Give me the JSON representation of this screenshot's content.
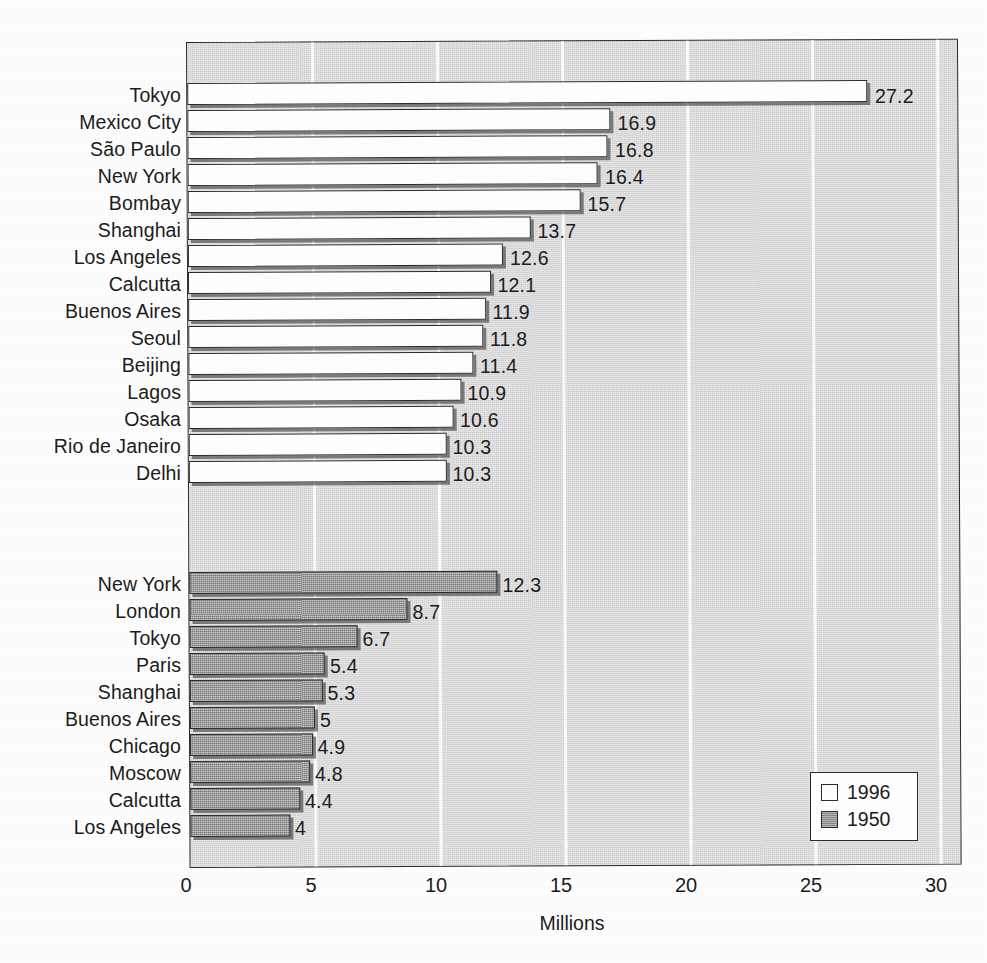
{
  "chart_data": {
    "type": "bar",
    "orientation": "horizontal",
    "title": "",
    "xlabel": "Millions",
    "ylabel": "",
    "xlim": [
      0,
      30
    ],
    "xticks": [
      "0",
      "5",
      "10",
      "15",
      "20",
      "25",
      "30"
    ],
    "grid": "vertical-white-gridlines",
    "legend_position": "bottom-right",
    "series": [
      {
        "name": "1996",
        "color": "#ffffff",
        "categories": [
          "Tokyo",
          "Mexico City",
          "São Paulo",
          "New York",
          "Bombay",
          "Shanghai",
          "Los Angeles",
          "Calcutta",
          "Buenos Aires",
          "Seoul",
          "Beijing",
          "Lagos",
          "Osaka",
          "Rio de Janeiro",
          "Delhi"
        ],
        "values": [
          27.2,
          16.9,
          16.8,
          16.4,
          15.7,
          13.7,
          12.6,
          12.1,
          11.9,
          11.8,
          11.4,
          10.9,
          10.6,
          10.3,
          10.3
        ],
        "labels": [
          "27.2",
          "16.9",
          "16.8",
          "16.4",
          "15.7",
          "13.7",
          "12.6",
          "12.1",
          "11.9",
          "11.8",
          "11.4",
          "10.9",
          "10.6",
          "10.3",
          "10.3"
        ]
      },
      {
        "name": "1950",
        "color": "#9a9a9a",
        "categories": [
          "New York",
          "London",
          "Tokyo",
          "Paris",
          "Shanghai",
          "Buenos Aires",
          "Chicago",
          "Moscow",
          "Calcutta",
          "Los Angeles"
        ],
        "values": [
          12.3,
          8.7,
          6.7,
          5.4,
          5.3,
          5,
          4.9,
          4.8,
          4.4,
          4
        ],
        "labels": [
          "12.3",
          "8.7",
          "6.7",
          "5.4",
          "5.3",
          "5",
          "4.9",
          "4.8",
          "4.4",
          "4"
        ]
      }
    ]
  },
  "legend": {
    "entries": [
      {
        "label": "1996",
        "swatch": "white-square-swatch"
      },
      {
        "label": "1950",
        "swatch": "gray-square-swatch"
      }
    ]
  },
  "axis": {
    "x_title": "Millions",
    "x_tick_labels": [
      "0",
      "5",
      "10",
      "15",
      "20",
      "25",
      "30"
    ]
  },
  "colors": {
    "plot_background": "#d9d9d9",
    "gridline": "#fbfbfb",
    "bar_1996": "#ffffff",
    "bar_1950": "#9a9a9a",
    "outline": "#2b2b2b",
    "text": "#1c1c1c"
  }
}
